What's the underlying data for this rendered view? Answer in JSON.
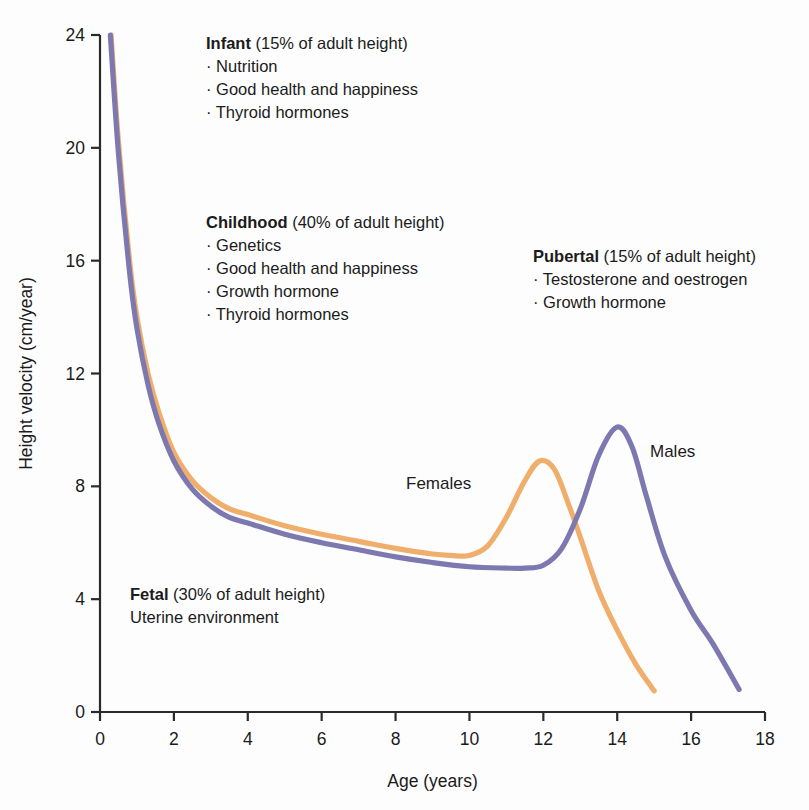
{
  "chart_data": {
    "type": "line",
    "title": "",
    "xlabel": "Age (years)",
    "ylabel": "Height velocity (cm/year)",
    "xlim": [
      0,
      18
    ],
    "ylim": [
      0,
      24
    ],
    "xticks": [
      0,
      2,
      4,
      6,
      8,
      10,
      12,
      14,
      16,
      18
    ],
    "yticks": [
      0,
      4,
      8,
      12,
      16,
      20,
      24
    ],
    "grid": false,
    "legend_position": "inline-labels",
    "series": [
      {
        "name": "Females",
        "color": "#f0ae6c",
        "peak_age": 11.9,
        "peak_value": 8.9,
        "x": [
          0.3,
          0.5,
          0.8,
          1.0,
          1.3,
          1.6,
          2.0,
          2.5,
          3.0,
          3.5,
          4.0,
          5.0,
          6.0,
          7.0,
          8.0,
          9.0,
          9.5,
          10.0,
          10.5,
          11.0,
          11.5,
          11.9,
          12.3,
          12.7,
          13.0,
          13.5,
          14.0,
          14.5,
          15.0
        ],
        "y": [
          24.0,
          20.2,
          16.0,
          14.0,
          12.0,
          10.6,
          9.2,
          8.2,
          7.6,
          7.2,
          7.0,
          6.6,
          6.3,
          6.05,
          5.8,
          5.6,
          5.55,
          5.55,
          5.9,
          6.9,
          8.2,
          8.9,
          8.6,
          7.3,
          6.2,
          4.3,
          2.9,
          1.7,
          0.75
        ]
      },
      {
        "name": "Males",
        "color": "#7d79b0",
        "peak_age": 14.0,
        "peak_value": 10.1,
        "x": [
          0.28,
          0.5,
          0.8,
          1.0,
          1.3,
          1.6,
          2.0,
          2.5,
          3.0,
          3.5,
          4.0,
          5.0,
          6.0,
          7.0,
          8.0,
          9.0,
          10.0,
          11.0,
          11.5,
          12.0,
          12.5,
          13.0,
          13.5,
          14.0,
          14.4,
          14.8,
          15.3,
          16.0,
          16.6,
          17.3
        ],
        "y": [
          24.0,
          19.8,
          15.6,
          13.6,
          11.6,
          10.2,
          8.9,
          7.9,
          7.3,
          6.9,
          6.7,
          6.3,
          6.0,
          5.75,
          5.5,
          5.3,
          5.15,
          5.1,
          5.1,
          5.2,
          5.8,
          7.2,
          9.1,
          10.1,
          9.4,
          7.6,
          5.5,
          3.6,
          2.4,
          0.8
        ]
      }
    ],
    "annotations": [
      {
        "id": "infant",
        "heading": "Infant",
        "subtitle": "(15% of adult height)",
        "bullets": [
          "Nutrition",
          "Good health and happiness",
          "Thyroid hormones"
        ],
        "plain": []
      },
      {
        "id": "childhood",
        "heading": "Childhood",
        "subtitle": "(40% of adult height)",
        "bullets": [
          "Genetics",
          "Good health and  happiness",
          "Growth hormone",
          "Thyroid hormones"
        ],
        "plain": []
      },
      {
        "id": "pubertal",
        "heading": "Pubertal",
        "subtitle": "(15% of adult height)",
        "bullets": [
          "Testosterone and oestrogen",
          "Growth hormone"
        ],
        "plain": []
      },
      {
        "id": "fetal",
        "heading": "Fetal",
        "subtitle": "(30% of adult height)",
        "bullets": [],
        "plain": [
          "Uterine environment"
        ]
      }
    ]
  },
  "labels": {
    "bullet_glyph": "·",
    "females": "Females",
    "males": "Males"
  },
  "colors": {
    "female_curve": "#f0ae6c",
    "male_curve": "#7d79b0",
    "axis": "#2a2a2a",
    "text": "#1b1b1b",
    "background": "#fdfdfd"
  }
}
